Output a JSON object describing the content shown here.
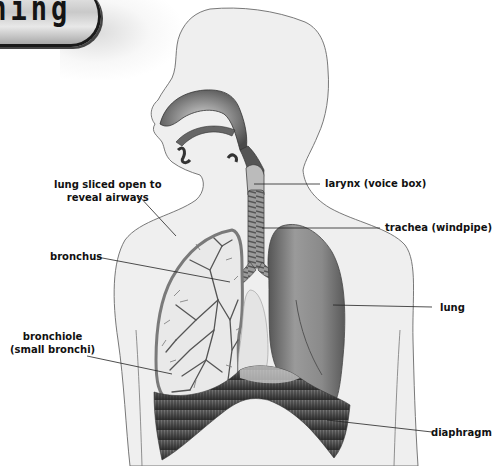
{
  "banner": {
    "text": "thing"
  },
  "diagram": {
    "labels": {
      "lung_sliced_line1": "lung sliced open to",
      "lung_sliced_line2": "reveal airways",
      "larynx": "larynx (voice box)",
      "trachea": "trachea (windpipe)",
      "bronchus": "bronchus",
      "lung": "lung",
      "bronchiole_line1": "bronchiole",
      "bronchiole_line2": "(small bronchi)",
      "diaphragm": "diaphragm"
    }
  },
  "colors": {
    "body_fill": "#efefef",
    "outline": "#6a6a6a",
    "organ_dark": "#4a4a4a",
    "organ_mid": "#8a8a8a",
    "label_text": "#111111"
  }
}
